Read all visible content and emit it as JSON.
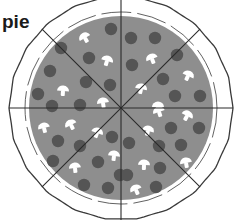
{
  "label": "pie",
  "pizza": {
    "center": [
      121,
      108
    ],
    "crust_radius": 112,
    "sauce_radius": 92,
    "slices": 8,
    "colors": {
      "crust": "#ffffff",
      "outline": "#3a3a3a",
      "sauce": "#8e8e8e",
      "pepperoni": "#555555",
      "mushroom": "#ffffff"
    },
    "pepperoni": [
      [
        111,
        29
      ],
      [
        61,
        48
      ],
      [
        89,
        58
      ],
      [
        50,
        71
      ],
      [
        86,
        82
      ],
      [
        110,
        85
      ],
      [
        38,
        94
      ],
      [
        52,
        106
      ],
      [
        80,
        105
      ],
      [
        131,
        38
      ],
      [
        155,
        38
      ],
      [
        132,
        65
      ],
      [
        177,
        55
      ],
      [
        163,
        79
      ],
      [
        175,
        96
      ],
      [
        200,
        96
      ],
      [
        58,
        141
      ],
      [
        80,
        146
      ],
      [
        112,
        137
      ],
      [
        53,
        161
      ],
      [
        98,
        162
      ],
      [
        84,
        185
      ],
      [
        108,
        188
      ],
      [
        120,
        175
      ],
      [
        171,
        128
      ],
      [
        199,
        128
      ],
      [
        129,
        143
      ],
      [
        159,
        146
      ],
      [
        181,
        145
      ],
      [
        160,
        168
      ],
      [
        127,
        175
      ],
      [
        156,
        187
      ]
    ],
    "mushrooms": [
      [
        85,
        38
      ],
      [
        107,
        61
      ],
      [
        63,
        91
      ],
      [
        103,
        103
      ],
      [
        152,
        59
      ],
      [
        188,
        76
      ],
      [
        141,
        89
      ],
      [
        158,
        107
      ],
      [
        44,
        128
      ],
      [
        71,
        125
      ],
      [
        97,
        133
      ],
      [
        114,
        156
      ],
      [
        75,
        168
      ],
      [
        159,
        112
      ],
      [
        187,
        116
      ],
      [
        148,
        131
      ],
      [
        144,
        165
      ],
      [
        186,
        163
      ],
      [
        136,
        190
      ]
    ]
  }
}
